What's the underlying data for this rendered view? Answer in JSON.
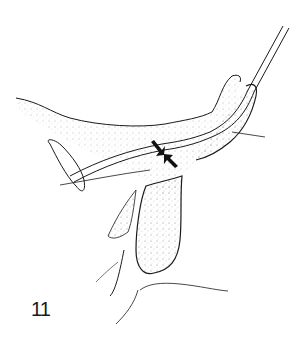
{
  "figure": {
    "number_label": "11",
    "type": "anatomical line drawing",
    "annotations": [
      {
        "name": "arrow-upper",
        "direction": "down-right"
      },
      {
        "name": "arrow-lower",
        "direction": "up-left"
      }
    ],
    "colors": {
      "ink": "#1a1a1a",
      "background": "#ffffff",
      "stipple": "#555555"
    }
  }
}
